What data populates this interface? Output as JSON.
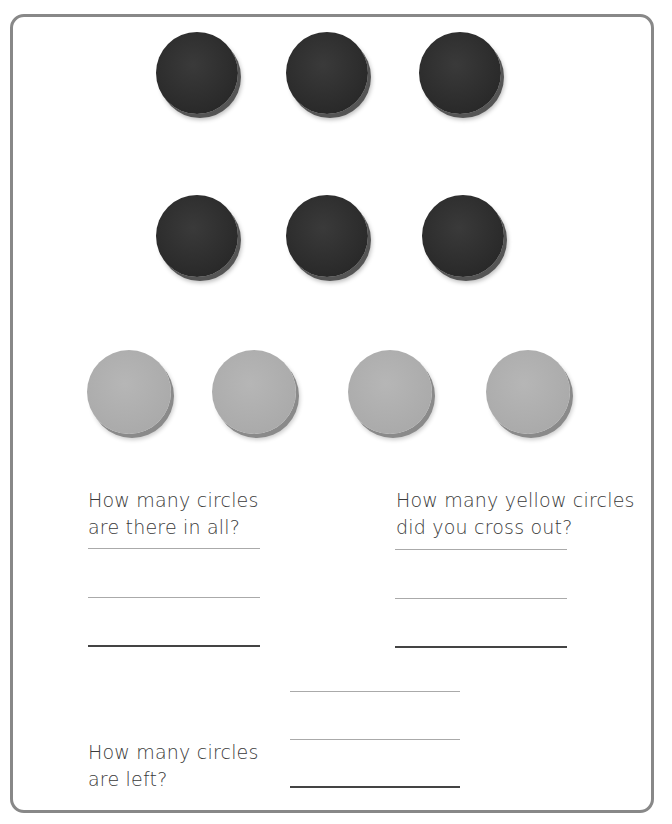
{
  "worksheet": {
    "dark_circles": [
      {
        "row": 1,
        "x": 156,
        "y": 32
      },
      {
        "row": 1,
        "x": 286,
        "y": 32
      },
      {
        "row": 1,
        "x": 419,
        "y": 32
      },
      {
        "row": 2,
        "x": 156,
        "y": 195
      },
      {
        "row": 2,
        "x": 286,
        "y": 195
      },
      {
        "row": 2,
        "x": 422,
        "y": 195
      }
    ],
    "yellow_circles": [
      {
        "x": 87,
        "y": 350
      },
      {
        "x": 212,
        "y": 350
      },
      {
        "x": 348,
        "y": 350
      },
      {
        "x": 486,
        "y": 350
      }
    ],
    "questions": {
      "total": {
        "line1": "How many circles",
        "line2": "are there in all?"
      },
      "crossed_out": {
        "line1": "How many yellow circles",
        "line2": "did you cross out?"
      },
      "left": {
        "line1": "How many circles",
        "line2": "are left?"
      }
    },
    "answers": {
      "total": "",
      "crossed_out": "",
      "left": ""
    },
    "colors": {
      "frame": "#888888",
      "dark_circle": "#2a2a2a",
      "yellow_circle": "#aaaaaa"
    }
  }
}
